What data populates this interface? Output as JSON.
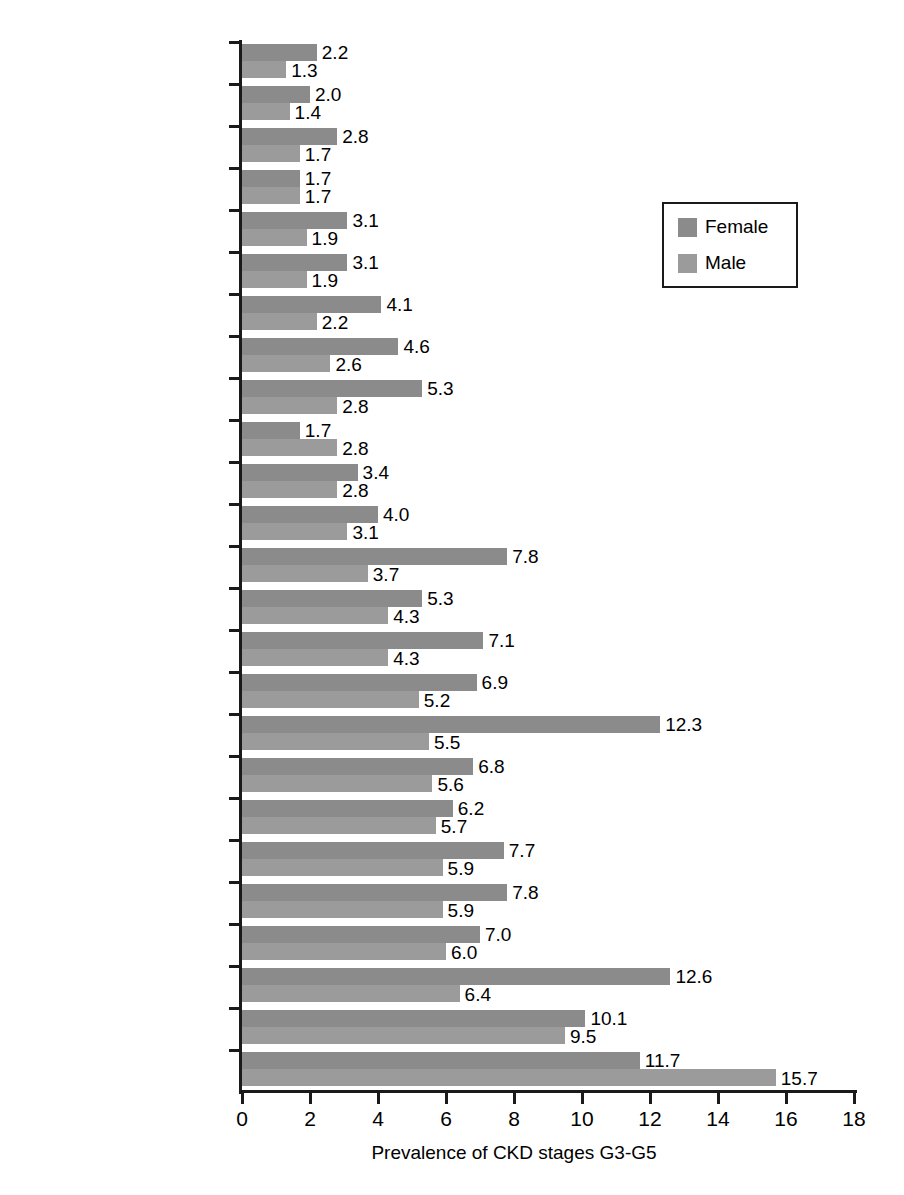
{
  "chart_data": {
    "type": "bar",
    "orientation": "horizontal",
    "title": "",
    "xlabel": "Prevalence of CKD stages G3-G5",
    "ylabel": "",
    "xlim": [
      0,
      18
    ],
    "xticks": [
      0,
      2,
      4,
      6,
      8,
      10,
      12,
      14,
      16,
      18
    ],
    "grid": false,
    "legend_position": "upper right",
    "categories": [
      "China",
      "Beijing. China",
      "Germany",
      "Chennai. India",
      "Tibet",
      "Finland",
      "Southern China",
      "Korea",
      "Turkey",
      "Singapore",
      "Canada",
      "Delhi. India",
      "Portugal",
      "Australia",
      "Black Sea region. Turkey",
      "Stockholm. Sweden",
      "Thailand",
      "Poland",
      "Gubbio. central Italy",
      "Spain",
      "USA",
      "UK",
      "France",
      "Urumqi. China",
      "Japan"
    ],
    "series": [
      {
        "name": "Female",
        "color": "#8b8b8b",
        "values": [
          2.2,
          2.0,
          2.8,
          1.7,
          3.1,
          3.1,
          4.1,
          4.6,
          5.3,
          1.7,
          3.4,
          4.0,
          7.8,
          5.3,
          7.1,
          6.9,
          12.3,
          6.8,
          6.2,
          7.7,
          7.8,
          7.0,
          12.6,
          10.1,
          11.7
        ],
        "labels": [
          "2.2",
          "2.0",
          "2.8",
          "1.7",
          "3.1",
          "3.1",
          "4.1",
          "4.6",
          "5.3",
          "1.7",
          "3.4",
          "4.0",
          "7.8",
          "5.3",
          "7.1",
          "6.9",
          "12.3",
          "6.8",
          "6.2",
          "7.7",
          "7.8",
          "7.0",
          "12.6",
          "10.1",
          "11.7"
        ]
      },
      {
        "name": "Male",
        "color": "#9b9b9b",
        "values": [
          1.3,
          1.4,
          1.7,
          1.7,
          1.9,
          1.9,
          2.2,
          2.6,
          2.8,
          2.8,
          2.8,
          3.1,
          3.7,
          4.3,
          4.3,
          5.2,
          5.5,
          5.6,
          5.7,
          5.9,
          5.9,
          6.0,
          6.4,
          9.5,
          15.7
        ],
        "labels": [
          "1.3",
          "1.4",
          "1.7",
          "1.7",
          "1.9",
          "1.9",
          "2.2",
          "2.6",
          "2.8",
          "2.8",
          "2.8",
          "3.1",
          "3.7",
          "4.3",
          "4.3",
          "5.2",
          "5.5",
          "5.6",
          "5.7",
          "5.9",
          "5.9",
          "6.0",
          "6.4",
          "9.5",
          "15.7"
        ]
      }
    ]
  },
  "legend": {
    "items": [
      {
        "label": "Female",
        "color": "#8b8b8b"
      },
      {
        "label": "Male",
        "color": "#9b9b9b"
      }
    ]
  },
  "axis": {
    "x_title": "Prevalence of CKD stages G3-G5",
    "x_tick_labels": [
      "0",
      "2",
      "4",
      "6",
      "8",
      "10",
      "12",
      "14",
      "16",
      "18"
    ]
  }
}
